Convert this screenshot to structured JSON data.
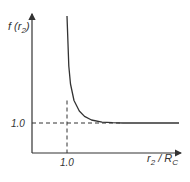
{
  "chart_data": {
    "type": "line",
    "title": "",
    "ylabel": "f (r2)",
    "ylabel_main": "f (r",
    "ylabel_sub": "2",
    "ylabel_close": ")",
    "xlabel": "r2 / RC",
    "xlabel_r": "r",
    "xlabel_r_sub": "2",
    "xlabel_slash": " / R",
    "xlabel_R_sub": "C",
    "x_tick_labels": [
      "1.0"
    ],
    "y_tick_labels": [
      "1.0"
    ],
    "xlim": [
      0,
      4.2
    ],
    "ylim": [
      0,
      5.5
    ],
    "asymptote_x": 1.0,
    "asymptote_y": 1.0,
    "series": [
      {
        "name": "f(r2)",
        "x": [
          1.0,
          1.05,
          1.1,
          1.2,
          1.35,
          1.5,
          1.7,
          2.0,
          2.3,
          2.6,
          3.0,
          4.2
        ],
        "y": [
          5.5,
          2.9,
          2.3,
          1.75,
          1.4,
          1.22,
          1.1,
          1.03,
          1.01,
          1.0,
          1.0,
          1.0
        ]
      }
    ],
    "reference_lines": [
      {
        "orientation": "horizontal",
        "value": 1.0,
        "style": "dashed"
      },
      {
        "orientation": "vertical",
        "value": 1.0,
        "style": "dashed"
      }
    ],
    "grid": false,
    "legend": "none"
  },
  "colors": {
    "ink": "#333333"
  }
}
